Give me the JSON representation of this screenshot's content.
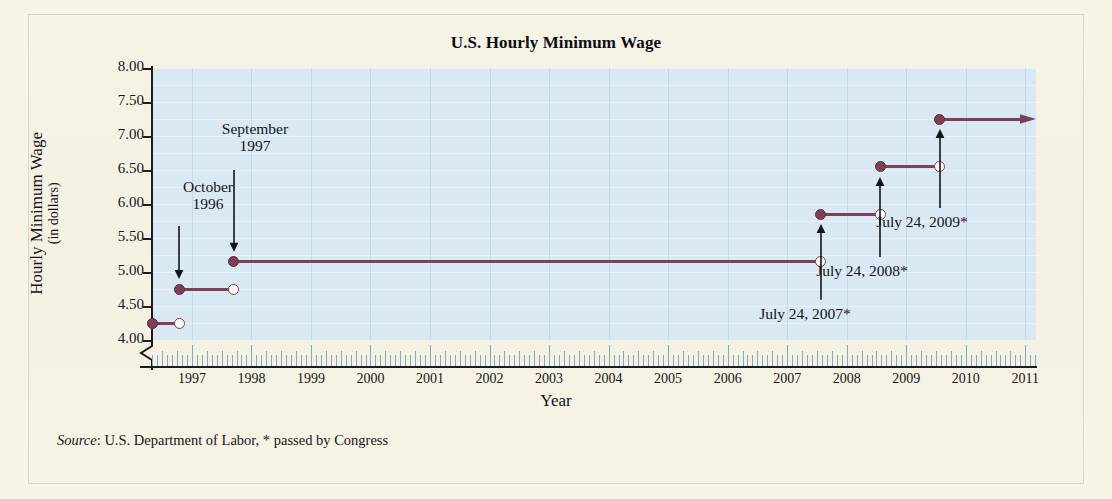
{
  "figure": {
    "title": "U.S. Hourly Minimum Wage",
    "source_prefix": "Source",
    "source_text": ": U.S. Department of Labor,  * passed by Congress",
    "background_color": "#f7f4e6",
    "plot_color": "#d9e9f3",
    "series_color": "#7e3f59"
  },
  "axes": {
    "y_title_line1": "Hourly Minimum Wage",
    "y_title_line2": "(in dollars)",
    "x_title": "Year",
    "y_ticks": [
      "8.00",
      "7.50",
      "7.00",
      "6.50",
      "6.00",
      "5.50",
      "5.00",
      "4.50",
      "4.00"
    ],
    "y_values": [
      8.0,
      7.5,
      7.0,
      6.5,
      6.0,
      5.5,
      5.0,
      4.5,
      4.0
    ],
    "x_ticks": [
      "1997",
      "1998",
      "1999",
      "2000",
      "2001",
      "2002",
      "2003",
      "2004",
      "2005",
      "2006",
      "2007",
      "2008",
      "2009",
      "2010",
      "2011"
    ],
    "y_min": 4.0,
    "y_max": 8.0,
    "x_min": 1996.33,
    "x_max": 2011.18,
    "axis_break": true,
    "grid": true
  },
  "annotations": [
    {
      "id": "oct-1996",
      "line1": "October",
      "line2": "1996"
    },
    {
      "id": "sep-1997",
      "line1": "September",
      "line2": "1997"
    },
    {
      "id": "jul-2007",
      "line1": "July 24, 2007*",
      "line2": ""
    },
    {
      "id": "jul-2008",
      "line1": "July 24, 2008*",
      "line2": ""
    },
    {
      "id": "jul-2009",
      "line1": "July 24, 2009*",
      "line2": ""
    }
  ],
  "chart_data": {
    "type": "line",
    "subtype": "step-function",
    "title": "U.S. Hourly Minimum Wage",
    "xlabel": "Year",
    "ylabel": "Hourly Minimum Wage (in dollars)",
    "xlim": [
      1996.33,
      2011.18
    ],
    "ylim": [
      4.0,
      8.0
    ],
    "grid": true,
    "legend": "none",
    "series": [
      {
        "name": "Federal hourly minimum wage",
        "color": "#7e3f59",
        "steps": [
          {
            "value": 4.25,
            "x_start": 1996.33,
            "x_end": 1996.79,
            "start_closed": true,
            "end_closed": false,
            "label": ""
          },
          {
            "value": 4.75,
            "x_start": 1996.79,
            "x_end": 1997.7,
            "start_closed": true,
            "end_closed": false,
            "label": "October 1996"
          },
          {
            "value": 5.15,
            "x_start": 1997.7,
            "x_end": 2007.56,
            "start_closed": true,
            "end_closed": false,
            "label": "September 1997"
          },
          {
            "value": 5.85,
            "x_start": 2007.56,
            "x_end": 2008.56,
            "start_closed": true,
            "end_closed": false,
            "label": "July 24, 2007*"
          },
          {
            "value": 6.55,
            "x_start": 2008.56,
            "x_end": 2009.56,
            "start_closed": true,
            "end_closed": false,
            "label": "July 24, 2008*"
          },
          {
            "value": 7.25,
            "x_start": 2009.56,
            "x_end": 2011.18,
            "start_closed": true,
            "end_closed": false,
            "label": "July 24, 2009*",
            "open_ended": true
          }
        ]
      }
    ]
  }
}
